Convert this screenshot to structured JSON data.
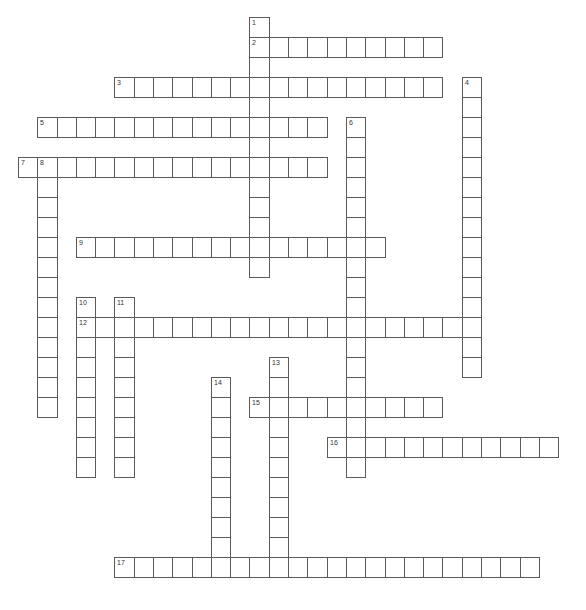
{
  "puzzle": {
    "grid": {
      "origin_x": 18,
      "origin_y": 17,
      "cell_w": 19.29,
      "cell_h": 20,
      "line_color": "#5a5a5a",
      "cell_fill": "#ffffff",
      "number_color": "#333333"
    },
    "words": [
      {
        "number": "1",
        "direction": "down",
        "row": 0,
        "col": 12,
        "length": 13
      },
      {
        "number": "2",
        "direction": "across",
        "row": 1,
        "col": 12,
        "length": 10
      },
      {
        "number": "3",
        "direction": "across",
        "row": 3,
        "col": 5,
        "length": 17
      },
      {
        "number": "4",
        "direction": "down",
        "row": 3,
        "col": 23,
        "length": 15
      },
      {
        "number": "5",
        "direction": "across",
        "row": 5,
        "col": 1,
        "length": 15
      },
      {
        "number": "6",
        "direction": "down",
        "row": 5,
        "col": 17,
        "length": 18
      },
      {
        "number": "7",
        "direction": "across",
        "row": 7,
        "col": 0,
        "length": 16
      },
      {
        "number": "8",
        "direction": "down",
        "row": 7,
        "col": 1,
        "length": 13
      },
      {
        "number": "9",
        "direction": "across",
        "row": 11,
        "col": 3,
        "length": 16
      },
      {
        "number": "10",
        "direction": "down",
        "row": 14,
        "col": 3,
        "length": 9
      },
      {
        "number": "11",
        "direction": "down",
        "row": 14,
        "col": 5,
        "length": 9
      },
      {
        "number": "12",
        "direction": "across",
        "row": 15,
        "col": 3,
        "length": 21
      },
      {
        "number": "13",
        "direction": "down",
        "row": 17,
        "col": 13,
        "length": 11
      },
      {
        "number": "14",
        "direction": "down",
        "row": 18,
        "col": 10,
        "length": 10
      },
      {
        "number": "15",
        "direction": "across",
        "row": 19,
        "col": 12,
        "length": 10
      },
      {
        "number": "16",
        "direction": "across",
        "row": 21,
        "col": 16,
        "length": 12
      },
      {
        "number": "17",
        "direction": "across",
        "row": 27,
        "col": 5,
        "length": 22
      }
    ]
  }
}
